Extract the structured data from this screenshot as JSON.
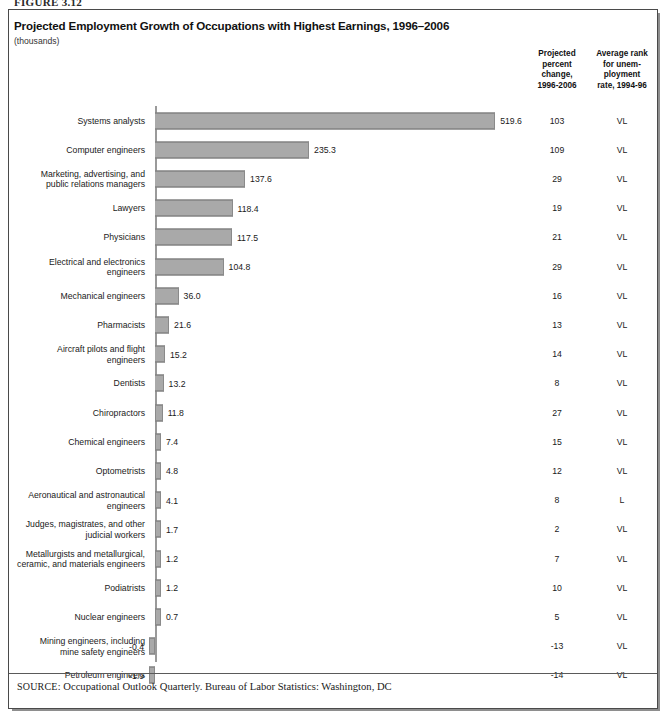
{
  "figure_number": "FIGURE 3.12",
  "header": {
    "title": "Projected Employment Growth of Occupations with Highest Earnings, 1996–2006",
    "subtitle": "(thousands)",
    "column_header_percent": "Projected\npercent\nchange,\n1996-2006",
    "column_header_rank": "Average rank\nfor unem-\nployment\nrate, 1994-96"
  },
  "source": {
    "label": "SOURCE:",
    "text": "Occupational Outlook Quarterly. Bureau of Labor Statistics: Washington, DC"
  },
  "chart_data": {
    "type": "bar",
    "orientation": "horizontal",
    "title": "Projected Employment Growth of Occupations with Highest Earnings, 1996–2006",
    "subtitle": "(thousands)",
    "xlabel": "",
    "ylabel": "",
    "units": "thousands",
    "grid": false,
    "legend": "none",
    "xlim": [
      -20,
      560
    ],
    "categories": [
      "Systems analysts",
      "Computer engineers",
      "Marketing, advertising, and public relations managers",
      "Lawyers",
      "Physicians",
      "Electrical and electronics engineers",
      "Mechanical engineers",
      "Pharmacists",
      "Aircraft pilots and flight engineers",
      "Dentists",
      "Chiropractors",
      "Chemical engineers",
      "Optometrists",
      "Aeronautical and astronautical engineers",
      "Judges, magistrates, and other judicial workers",
      "Metallurgists and metallurgical, ceramic, and materials engineers",
      "Podiatrists",
      "Nuclear engineers",
      "Mining engineers, including mine safety engineers",
      "Petroleum engineers"
    ],
    "values": [
      519.6,
      235.3,
      137.6,
      118.4,
      117.5,
      104.8,
      36.0,
      21.6,
      15.2,
      13.2,
      11.8,
      7.4,
      4.8,
      4.1,
      1.7,
      1.2,
      1.2,
      0.7,
      -0.4,
      -1.9
    ],
    "series": [
      {
        "name": "Projected employment growth, 1996-2006 (thousands)",
        "values": [
          519.6,
          235.3,
          137.6,
          118.4,
          117.5,
          104.8,
          36.0,
          21.6,
          15.2,
          13.2,
          11.8,
          7.4,
          4.8,
          4.1,
          1.7,
          1.2,
          1.2,
          0.7,
          -0.4,
          -1.9
        ]
      }
    ],
    "bar_color": "#a9a9a9",
    "bar_edge_color": "#6f6f6f"
  },
  "rows": [
    {
      "label_line1": "Systems analysts",
      "label_line2": "",
      "value": "519.6",
      "pct": "103",
      "rank": "VL"
    },
    {
      "label_line1": "Computer engineers",
      "label_line2": "",
      "value": "235.3",
      "pct": "109",
      "rank": "VL"
    },
    {
      "label_line1": "Marketing, advertising, and",
      "label_line2": "public relations managers",
      "value": "137.6",
      "pct": "29",
      "rank": "VL"
    },
    {
      "label_line1": "Lawyers",
      "label_line2": "",
      "value": "118.4",
      "pct": "19",
      "rank": "VL"
    },
    {
      "label_line1": "Physicians",
      "label_line2": "",
      "value": "117.5",
      "pct": "21",
      "rank": "VL"
    },
    {
      "label_line1": "Electrical and electronics",
      "label_line2": "engineers",
      "value": "104.8",
      "pct": "29",
      "rank": "VL"
    },
    {
      "label_line1": "Mechanical engineers",
      "label_line2": "",
      "value": "36.0",
      "pct": "16",
      "rank": "VL"
    },
    {
      "label_line1": "Pharmacists",
      "label_line2": "",
      "value": "21.6",
      "pct": "13",
      "rank": "VL"
    },
    {
      "label_line1": "Aircraft pilots and flight",
      "label_line2": "engineers",
      "value": "15.2",
      "pct": "14",
      "rank": "VL"
    },
    {
      "label_line1": "Dentists",
      "label_line2": "",
      "value": "13.2",
      "pct": "8",
      "rank": "VL"
    },
    {
      "label_line1": "Chiropractors",
      "label_line2": "",
      "value": "11.8",
      "pct": "27",
      "rank": "VL"
    },
    {
      "label_line1": "Chemical engineers",
      "label_line2": "",
      "value": "7.4",
      "pct": "15",
      "rank": "VL"
    },
    {
      "label_line1": "Optometrists",
      "label_line2": "",
      "value": "4.8",
      "pct": "12",
      "rank": "VL"
    },
    {
      "label_line1": "Aeronautical and astronautical",
      "label_line2": "engineers",
      "value": "4.1",
      "pct": "8",
      "rank": "L"
    },
    {
      "label_line1": "Judges, magistrates, and other",
      "label_line2": "judicial workers",
      "value": "1.7",
      "pct": "2",
      "rank": "VL"
    },
    {
      "label_line1": "Metallurgists and metallurgical,",
      "label_line2": "ceramic, and materials engineers",
      "value": "1.2",
      "pct": "7",
      "rank": "VL"
    },
    {
      "label_line1": "Podiatrists",
      "label_line2": "",
      "value": "1.2",
      "pct": "10",
      "rank": "VL"
    },
    {
      "label_line1": "Nuclear engineers",
      "label_line2": "",
      "value": "0.7",
      "pct": "5",
      "rank": "VL"
    },
    {
      "label_line1": "Mining engineers, including",
      "label_line2": "mine safety engineers",
      "value": "-0.4",
      "pct": "-13",
      "rank": "VL"
    },
    {
      "label_line1": "Petroleum engineers",
      "label_line2": "",
      "value": "-1.9",
      "pct": "-14",
      "rank": "VL"
    }
  ]
}
